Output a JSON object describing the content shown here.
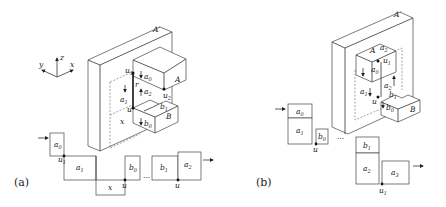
{
  "figure": {
    "panel_a": {
      "caption": "(a)",
      "axes": {
        "x": "x",
        "y": "y",
        "z": "z"
      },
      "wall_label": "A'",
      "block_labels": {
        "A": "A",
        "B": "B"
      },
      "three_d_labels": [
        "u1",
        "a0",
        "r",
        "a2",
        "u2",
        "a1",
        "b1",
        "u",
        "x",
        "b0"
      ],
      "strip_cells": [
        "a0",
        "a1",
        "x",
        "b0",
        "b1",
        "a2"
      ],
      "strip_points": [
        "u1",
        "u",
        "u"
      ],
      "ellipsis": "..."
    },
    "panel_b": {
      "caption": "(b)",
      "wall_label": "A'",
      "block_labels": {
        "A": "A",
        "B": "B"
      },
      "three_d_labels": [
        "a2",
        "u1",
        "a0",
        "a1",
        "u",
        "b0",
        "b1",
        "a2"
      ],
      "strip_cells": [
        "a0",
        "a1",
        "b0",
        "b1",
        "a2",
        "a3"
      ],
      "strip_points": [
        "u",
        "u1"
      ],
      "ellipsis": "..."
    }
  },
  "text": {
    "a_caption": "(a)",
    "b_caption": "(b)",
    "Aprime": "A'",
    "A": "A",
    "B": "B",
    "x": "x",
    "y": "y",
    "z": "z",
    "u": "u",
    "u1": "u",
    "u2": "u",
    "r": "r",
    "sub0": "0",
    "sub1": "1",
    "sub2": "2",
    "sub3": "3",
    "a": "a",
    "b": "b",
    "dots": "···"
  }
}
